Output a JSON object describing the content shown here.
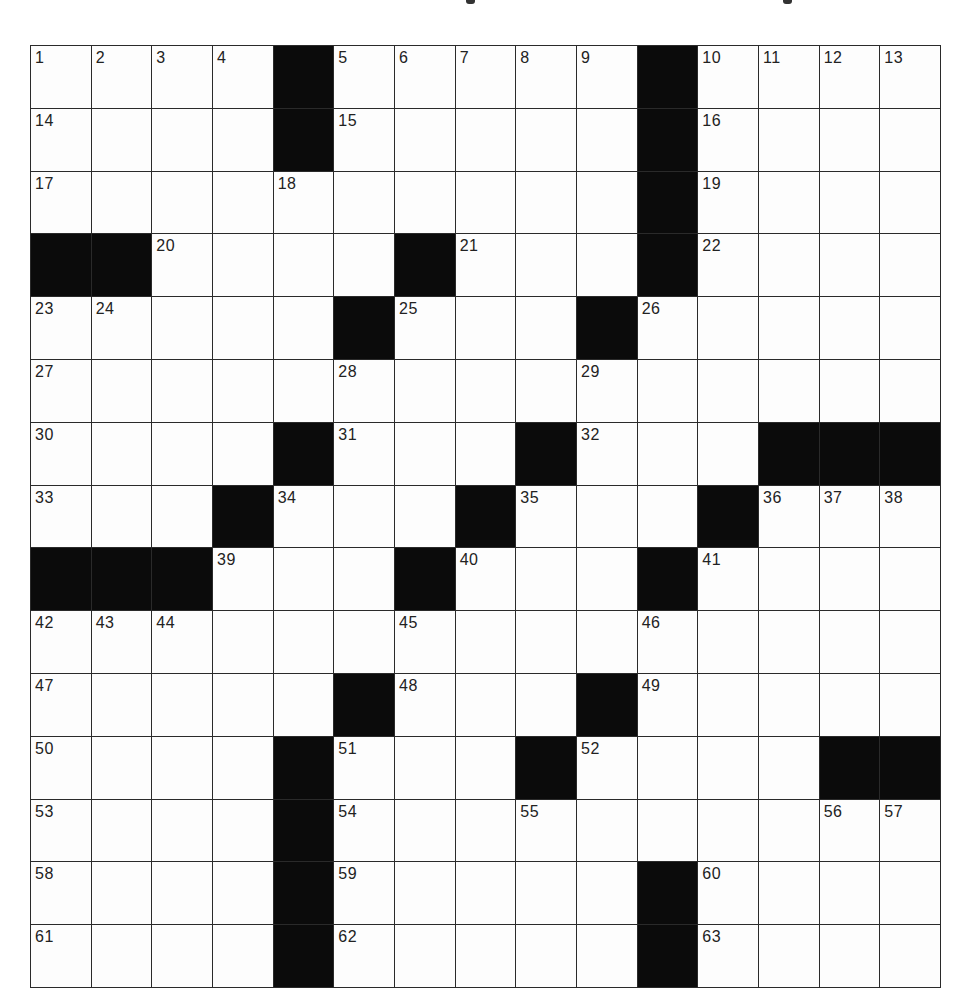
{
  "puzzle": {
    "type": "crossword",
    "rows": 15,
    "cols": 15,
    "header_marks": [
      {
        "left": 466,
        "width": 9
      },
      {
        "left": 783,
        "width": 9
      }
    ],
    "colors": {
      "block": "#0b0b0b",
      "cell": "#fdfdfd",
      "grid_line": "#2a2a2a",
      "number_text": "#222222"
    },
    "layout": [
      "1 2 3 4 # 5 6 7 8 9 # 10 11 12 13",
      "14 . . . # 15 . . . . # 16 . . .",
      "17 . . . 18 . . . . . # 19 . . .",
      "# # 20 . . . # 21 . . # 22 . . .",
      "23 24 . . . # 25 . . # 26 . . . .",
      "27 . . . . 28 . . . 29 . . . . .",
      "30 . . . # 31 . . # 32 . . # # #",
      "33 . . # 34 . . # 35 . . # 36 37 38",
      "# # # 39 . . # 40 . . # 41 . . .",
      "42 43 44 . . . 45 . . . 46 . . . .",
      "47 . . . . # 48 . . # 49 . . . .",
      "50 . . . # 51 . . # 52 . . . # #",
      "53 . . . # 54 . . 55 . . . . 56 57",
      "58 . . . # 59 . . . . # 60 . . .",
      "61 . . . # 62 . . . . # 63 . . ."
    ],
    "entries": {}
  }
}
